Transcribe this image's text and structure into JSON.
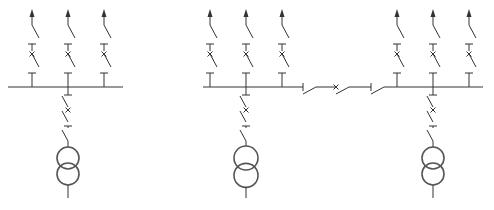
{
  "diagram": {
    "type": "electrical-single-line-diagram",
    "colors": {
      "line": "#333333",
      "transformer": "#555555",
      "background": "#ffffff"
    },
    "sections": [
      {
        "id": "section-left",
        "feeders": [
          {
            "id": "feeder-1",
            "symbols": [
              "arrow",
              "disconnector",
              "ground-bar",
              "breaker",
              "disconnector",
              "ground-bar"
            ]
          },
          {
            "id": "feeder-2",
            "symbols": [
              "arrow",
              "disconnector",
              "ground-bar",
              "breaker",
              "disconnector",
              "ground-bar"
            ]
          },
          {
            "id": "feeder-3",
            "symbols": [
              "arrow",
              "disconnector",
              "ground-bar",
              "breaker",
              "disconnector",
              "ground-bar"
            ]
          }
        ],
        "incomer": {
          "symbols": [
            "ground-bar",
            "disconnector",
            "breaker",
            "disconnector",
            "ground-bar",
            "disconnector",
            "two-winding-transformer"
          ]
        }
      },
      {
        "id": "section-middle",
        "feeders": [
          {
            "id": "feeder-4",
            "symbols": [
              "arrow",
              "disconnector",
              "ground-bar",
              "breaker",
              "disconnector",
              "ground-bar"
            ]
          },
          {
            "id": "feeder-5",
            "symbols": [
              "arrow",
              "disconnector",
              "ground-bar",
              "breaker",
              "disconnector",
              "ground-bar"
            ]
          },
          {
            "id": "feeder-6",
            "symbols": [
              "arrow",
              "disconnector",
              "ground-bar",
              "breaker",
              "disconnector",
              "ground-bar"
            ]
          }
        ],
        "incomer": {
          "symbols": [
            "ground-bar",
            "disconnector",
            "breaker",
            "disconnector",
            "ground-bar",
            "disconnector",
            "two-winding-transformer"
          ]
        }
      },
      {
        "id": "section-right",
        "feeders": [
          {
            "id": "feeder-7",
            "symbols": [
              "arrow",
              "disconnector",
              "ground-bar",
              "breaker",
              "disconnector",
              "ground-bar"
            ]
          },
          {
            "id": "feeder-8",
            "symbols": [
              "arrow",
              "disconnector",
              "ground-bar",
              "breaker",
              "disconnector",
              "ground-bar"
            ]
          },
          {
            "id": "feeder-9",
            "symbols": [
              "arrow",
              "disconnector",
              "ground-bar",
              "breaker",
              "disconnector",
              "ground-bar"
            ]
          }
        ],
        "incomer": {
          "symbols": [
            "ground-bar",
            "disconnector",
            "breaker",
            "disconnector",
            "ground-bar",
            "disconnector",
            "two-winding-transformer"
          ]
        }
      }
    ],
    "bus_coupler": {
      "between": [
        "section-middle",
        "section-right"
      ],
      "symbols": [
        "disconnector",
        "breaker",
        "disconnector"
      ]
    }
  }
}
